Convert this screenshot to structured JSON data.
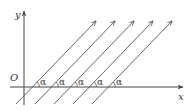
{
  "diagram": {
    "type": "coordinate-diagram",
    "axes": {
      "x_label": "x",
      "y_label": "y",
      "origin_label": "O"
    },
    "angle_label": "α",
    "line_count": 5,
    "colors": {
      "stroke": "#555555",
      "axis": "#444444",
      "text": "#333333"
    }
  }
}
